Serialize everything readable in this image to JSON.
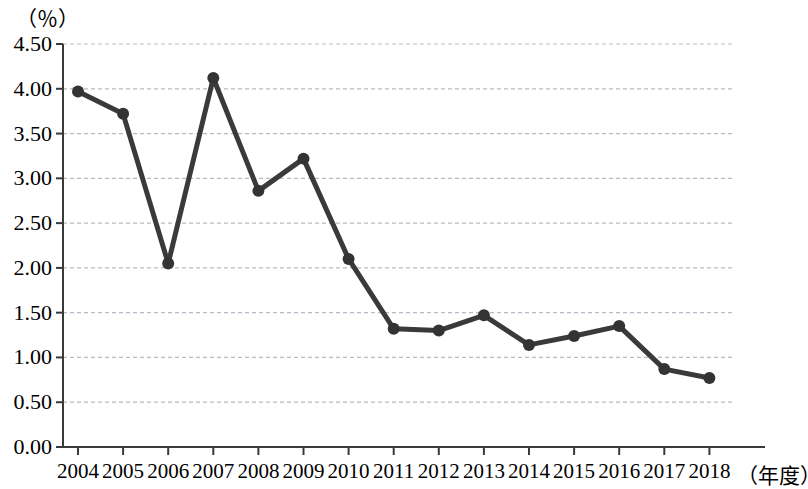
{
  "chart_data": {
    "type": "line",
    "title": "",
    "subtitle": "",
    "xlabel": "（年度）",
    "ylabel": "（％）",
    "unit_label_top": "（％）",
    "unit_label_right": "（年度）",
    "categories": [
      "2004",
      "2005",
      "2006",
      "2007",
      "2008",
      "2009",
      "2010",
      "2011",
      "2012",
      "2013",
      "2014",
      "2015",
      "2016",
      "2017",
      "2018"
    ],
    "values": [
      3.97,
      3.72,
      2.05,
      4.12,
      2.86,
      3.22,
      2.1,
      1.32,
      1.3,
      1.47,
      1.14,
      1.24,
      1.35,
      0.87,
      0.77
    ],
    "series": [
      {
        "name": "",
        "values": [
          3.97,
          3.72,
          2.05,
          4.12,
          2.86,
          3.22,
          2.1,
          1.32,
          1.3,
          1.47,
          1.14,
          1.24,
          1.35,
          0.87,
          0.77
        ]
      }
    ],
    "ylim": [
      0.0,
      4.5
    ],
    "ytick_values": [
      0.0,
      0.5,
      1.0,
      1.5,
      2.0,
      2.5,
      3.0,
      3.5,
      4.0,
      4.5
    ],
    "ytick_labels": [
      "0.00",
      "0.50",
      "1.00",
      "1.50",
      "2.00",
      "2.50",
      "3.00",
      "3.50",
      "4.00",
      "4.50"
    ],
    "xtick_labels": [
      "2004",
      "2005",
      "2006",
      "2007",
      "2008",
      "2009",
      "2010",
      "2011",
      "2012",
      "2013",
      "2014",
      "2015",
      "2016",
      "2017",
      "2018"
    ],
    "grid": true,
    "grid_axis": "y",
    "grid_style": "dashed",
    "legend": false,
    "legend_position": "none",
    "marker": "circle",
    "line_color": "#3a3a3a",
    "marker_color": "#333333",
    "grid_color": "#b9b9c8",
    "axis_color": "#3a3a3a",
    "background_color": "#ffffff"
  }
}
